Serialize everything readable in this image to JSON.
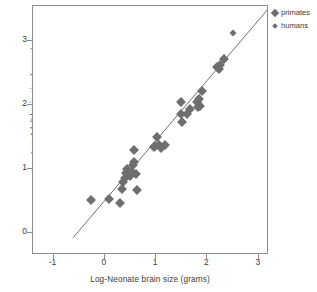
{
  "chart_data": {
    "type": "scatter",
    "title": "",
    "xlabel": "Log-Neonate brain size (grams)",
    "ylabel": "Log-Adult brain size (grams)",
    "xlim": [
      -1.4,
      3.2
    ],
    "ylim": [
      -0.35,
      3.55
    ],
    "xticks": [
      -1,
      0,
      1,
      2,
      3
    ],
    "xtick_labels": [
      "-1",
      "0",
      "1",
      "2",
      "3"
    ],
    "yticks": [
      0,
      1,
      2,
      3
    ],
    "ytick_labels": [
      "0",
      "1",
      "2",
      "3"
    ],
    "grid": false,
    "legend_position": "top-right",
    "marker_color": "#6e6e6e",
    "line_color": "#6e6e6e",
    "frame_color": "#8c8c8c",
    "legend": [
      {
        "name": "primates",
        "marker": "diamond",
        "size": "large"
      },
      {
        "name": "humans",
        "marker": "diamond",
        "size": "small"
      }
    ],
    "fit_line": {
      "x_start": -0.62,
      "y_start": -0.08,
      "x_end": 3.2,
      "y_end": 3.52
    },
    "series": [
      {
        "name": "primates",
        "marker": "diamond",
        "points": [
          [
            -0.26,
            0.51
          ],
          [
            0.08,
            0.53
          ],
          [
            0.3,
            0.47
          ],
          [
            0.33,
            0.68
          ],
          [
            0.36,
            0.8
          ],
          [
            0.4,
            0.86
          ],
          [
            0.42,
            0.94
          ],
          [
            0.44,
            0.99
          ],
          [
            0.5,
            0.88
          ],
          [
            0.52,
            0.95
          ],
          [
            0.55,
            1.06
          ],
          [
            0.57,
            1.11
          ],
          [
            0.56,
            1.3
          ],
          [
            0.6,
            0.92
          ],
          [
            0.62,
            0.67
          ],
          [
            0.95,
            1.34
          ],
          [
            0.98,
            1.36
          ],
          [
            1.02,
            1.5
          ],
          [
            1.05,
            1.37
          ],
          [
            1.1,
            1.33
          ],
          [
            1.17,
            1.38
          ],
          [
            1.48,
            2.04
          ],
          [
            1.49,
            1.86
          ],
          [
            1.5,
            1.74
          ],
          [
            1.6,
            1.86
          ],
          [
            1.66,
            1.93
          ],
          [
            1.8,
            2.04
          ],
          [
            1.82,
            1.97
          ],
          [
            1.83,
            2.1
          ],
          [
            1.86,
            1.99
          ],
          [
            1.89,
            2.22
          ],
          [
            2.18,
            2.6
          ],
          [
            2.22,
            2.56
          ],
          [
            2.24,
            2.62
          ],
          [
            2.33,
            2.72
          ]
        ]
      },
      {
        "name": "humans",
        "marker": "diamond",
        "points": [
          [
            2.5,
            3.13
          ]
        ]
      }
    ]
  }
}
